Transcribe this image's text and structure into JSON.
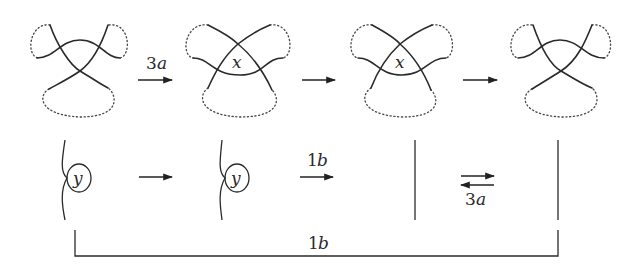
{
  "diagram": {
    "top_row": {
      "panels": [
        {
          "id": "knot-1",
          "label": ""
        },
        {
          "id": "knot-2",
          "label": "x"
        },
        {
          "id": "knot-3",
          "label": "x"
        },
        {
          "id": "knot-4",
          "label": ""
        }
      ],
      "arrows": [
        {
          "from": "knot-1",
          "to": "knot-2",
          "label_num": "3",
          "label_var": "a"
        },
        {
          "from": "knot-2",
          "to": "knot-3",
          "label_num": "",
          "label_var": ""
        },
        {
          "from": "knot-3",
          "to": "knot-4",
          "label_num": "",
          "label_var": ""
        }
      ]
    },
    "bottom_row": {
      "panels": [
        {
          "id": "strand-1",
          "circle_label": "y"
        },
        {
          "id": "strand-2",
          "circle_label": "y"
        },
        {
          "id": "strand-3",
          "circle_label": ""
        },
        {
          "id": "strand-4",
          "circle_label": ""
        }
      ],
      "arrows": [
        {
          "from": "strand-1",
          "to": "strand-2",
          "label_num": "",
          "label_var": ""
        },
        {
          "from": "strand-2",
          "to": "strand-3",
          "label_num": "1",
          "label_var": "b"
        },
        {
          "from": "strand-3",
          "to": "strand-4",
          "bidirectional": true,
          "label_num": "3",
          "label_var": "a"
        }
      ]
    },
    "bracket": {
      "from": "strand-1",
      "to": "strand-4",
      "label_num": "1",
      "label_var": "b"
    }
  }
}
